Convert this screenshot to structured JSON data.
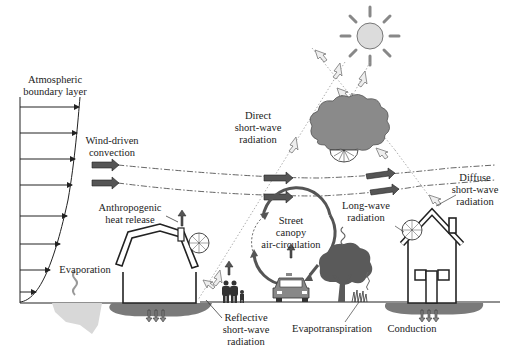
{
  "diagram": {
    "labels": {
      "abl_line1": "Atmospheric",
      "abl_line2": "boundary layer",
      "wind_line1": "Wind-driven",
      "wind_line2": "convection",
      "direct_line1": "Direct",
      "direct_line2": "short-wave",
      "direct_line3": "radiation",
      "diffuse_line1": "Diffuse",
      "diffuse_line2": "short-wave",
      "diffuse_line3": "radiation",
      "longwave_line1": "Long-wave",
      "longwave_line2": "radiation",
      "anthro_line1": "Anthropogenic",
      "anthro_line2": "heat release",
      "street_line1": "Street",
      "street_line2": "canopy",
      "street_line3": "air-circulation",
      "evaporation": "Evaporation",
      "reflective_line1": "Reflective",
      "reflective_line2": "short-wave",
      "reflective_line3": "radiation",
      "evapotranspiration": "Evapotranspiration",
      "conduction": "Conduction"
    },
    "colors": {
      "line": "#222222",
      "cloud": "#8a8a8a",
      "tree": "#5a5a5a",
      "ground": "#7a7a7a",
      "sun": "#dcdcdc",
      "arrow_dark": "#555555",
      "arrow_light": "#e0e0e0"
    }
  }
}
